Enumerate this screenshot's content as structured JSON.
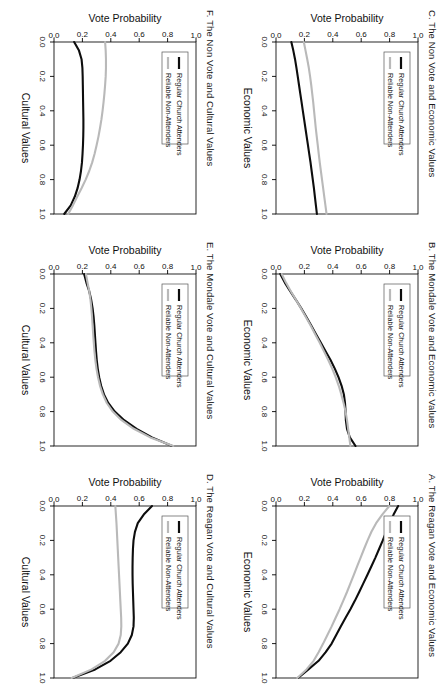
{
  "figure": {
    "orientation": "rotated-90-landscape",
    "series_colors": {
      "black": "#0d0d0d",
      "gray": "#b9b9b9"
    },
    "legend": {
      "series_1_label": "Regular Church Attenders",
      "series_2_label": "Reliable Non-Attenders"
    },
    "axis": {
      "ylabel": "Vote Probability",
      "ticks": [
        "0.0",
        "0.2",
        "0.4",
        "0.6",
        "0.8",
        "1.0"
      ]
    }
  },
  "chart_data": [
    {
      "id": "A",
      "type": "line",
      "title": "A. The Reagan Vote and Economic Values",
      "xlabel": "Economic Values",
      "ylabel": "Vote Probability",
      "xlim": [
        0.0,
        1.0
      ],
      "ylim": [
        0.0,
        1.0
      ],
      "xticks": [
        "0.0",
        "0.2",
        "0.4",
        "0.6",
        "0.8",
        "1.0"
      ],
      "yticks": [
        "0.0",
        "0.2",
        "0.4",
        "0.6",
        "0.8",
        "1.0"
      ],
      "grid": false,
      "legend_position": "top-left",
      "x": [
        0.0,
        0.05,
        0.1,
        0.15,
        0.2,
        0.25,
        0.3,
        0.35,
        0.4,
        0.45,
        0.5,
        0.55,
        0.6,
        0.65,
        0.7,
        0.75,
        0.8,
        0.85,
        0.9,
        0.95,
        1.0
      ],
      "series": [
        {
          "name": "Regular Church Attenders",
          "color": "#0d0d0d",
          "values": [
            0.86,
            0.828,
            0.8,
            0.776,
            0.752,
            0.726,
            0.7,
            0.672,
            0.644,
            0.615,
            0.586,
            0.556,
            0.524,
            0.49,
            0.456,
            0.424,
            0.392,
            0.35,
            0.3,
            0.228,
            0.155
          ]
        },
        {
          "name": "Reliable Non-Attenders",
          "color": "#b9b9b9",
          "values": [
            0.798,
            0.748,
            0.705,
            0.672,
            0.645,
            0.62,
            0.596,
            0.572,
            0.548,
            0.524,
            0.5,
            0.474,
            0.448,
            0.42,
            0.392,
            0.362,
            0.332,
            0.3,
            0.265,
            0.215,
            0.15
          ]
        }
      ]
    },
    {
      "id": "B",
      "type": "line",
      "title": "B. The Mondale Vote and Economic Values",
      "xlabel": "Economic Values",
      "ylabel": "Vote Probability",
      "xlim": [
        0.0,
        1.0
      ],
      "ylim": [
        0.0,
        1.0
      ],
      "xticks": [
        "0.0",
        "0.2",
        "0.4",
        "0.6",
        "0.8",
        "1.0"
      ],
      "yticks": [
        "0.0",
        "0.2",
        "0.4",
        "0.6",
        "0.8",
        "1.0"
      ],
      "grid": false,
      "legend_position": "top-left",
      "x": [
        0.0,
        0.05,
        0.1,
        0.15,
        0.2,
        0.25,
        0.3,
        0.35,
        0.4,
        0.45,
        0.5,
        0.55,
        0.6,
        0.65,
        0.7,
        0.75,
        0.8,
        0.85,
        0.9,
        0.95,
        1.0
      ],
      "series": [
        {
          "name": "Regular Church Attenders",
          "color": "#0d0d0d",
          "values": [
            0.03,
            0.062,
            0.1,
            0.14,
            0.178,
            0.214,
            0.248,
            0.282,
            0.316,
            0.35,
            0.384,
            0.414,
            0.44,
            0.462,
            0.478,
            0.486,
            0.49,
            0.492,
            0.5,
            0.52,
            0.56
          ]
        },
        {
          "name": "Reliable Non-Attenders",
          "color": "#b9b9b9",
          "values": [
            0.04,
            0.07,
            0.104,
            0.14,
            0.176,
            0.21,
            0.244,
            0.276,
            0.308,
            0.338,
            0.368,
            0.396,
            0.42,
            0.442,
            0.46,
            0.476,
            0.49,
            0.5,
            0.508,
            0.516,
            0.524
          ]
        }
      ]
    },
    {
      "id": "C",
      "type": "line",
      "title": "C. The Non Vote and Economic Values",
      "xlabel": "Economic Values",
      "ylabel": "Vote Probability",
      "xlim": [
        0.0,
        1.0
      ],
      "ylim": [
        0.0,
        1.0
      ],
      "xticks": [
        "0.0",
        "0.2",
        "0.4",
        "0.6",
        "0.8",
        "1.0"
      ],
      "yticks": [
        "0.0",
        "0.2",
        "0.4",
        "0.6",
        "0.8",
        "1.0"
      ],
      "grid": false,
      "legend_position": "top-left",
      "x": [
        0.0,
        0.05,
        0.1,
        0.15,
        0.2,
        0.25,
        0.3,
        0.35,
        0.4,
        0.45,
        0.5,
        0.55,
        0.6,
        0.65,
        0.7,
        0.75,
        0.8,
        0.85,
        0.9,
        0.95,
        1.0
      ],
      "series": [
        {
          "name": "Regular Church Attenders",
          "color": "#0d0d0d",
          "values": [
            0.108,
            0.122,
            0.134,
            0.144,
            0.153,
            0.162,
            0.171,
            0.18,
            0.189,
            0.198,
            0.207,
            0.216,
            0.225,
            0.234,
            0.243,
            0.251,
            0.259,
            0.267,
            0.274,
            0.281,
            0.288
          ]
        },
        {
          "name": "Reliable Non-Attenders",
          "color": "#b9b9b9",
          "values": [
            0.196,
            0.208,
            0.22,
            0.231,
            0.24,
            0.248,
            0.255,
            0.262,
            0.268,
            0.274,
            0.28,
            0.287,
            0.294,
            0.301,
            0.308,
            0.316,
            0.324,
            0.332,
            0.34,
            0.348,
            0.356
          ]
        }
      ]
    },
    {
      "id": "D",
      "type": "line",
      "title": "D. The Reagan Vote and Cultural Values",
      "xlabel": "Cultural Values",
      "ylabel": "Vote Probability",
      "xlim": [
        0.0,
        1.0
      ],
      "ylim": [
        0.0,
        1.0
      ],
      "xticks": [
        "0.0",
        "0.2",
        "0.4",
        "0.6",
        "0.8",
        "1.0"
      ],
      "yticks": [
        "0.0",
        "0.2",
        "0.4",
        "0.6",
        "0.8",
        "1.0"
      ],
      "grid": false,
      "legend_position": "top-left",
      "x": [
        0.0,
        0.05,
        0.1,
        0.15,
        0.2,
        0.25,
        0.3,
        0.35,
        0.4,
        0.45,
        0.5,
        0.55,
        0.6,
        0.65,
        0.7,
        0.75,
        0.8,
        0.85,
        0.9,
        0.95,
        1.0
      ],
      "series": [
        {
          "name": "Regular Church Attenders",
          "color": "#0d0d0d",
          "values": [
            0.69,
            0.632,
            0.59,
            0.57,
            0.56,
            0.556,
            0.554,
            0.553,
            0.553,
            0.554,
            0.556,
            0.558,
            0.56,
            0.562,
            0.56,
            0.548,
            0.52,
            0.47,
            0.398,
            0.29,
            0.13
          ]
        },
        {
          "name": "Reliable Non-Attenders",
          "color": "#b9b9b9",
          "values": [
            0.432,
            0.436,
            0.44,
            0.443,
            0.446,
            0.449,
            0.452,
            0.455,
            0.458,
            0.461,
            0.464,
            0.467,
            0.47,
            0.473,
            0.474,
            0.47,
            0.455,
            0.42,
            0.36,
            0.265,
            0.125
          ]
        }
      ]
    },
    {
      "id": "E",
      "type": "line",
      "title": "E. The Mondale Vote and Cultural Values",
      "xlabel": "Cultural Values",
      "ylabel": "Vote Probability",
      "xlim": [
        0.0,
        1.0
      ],
      "ylim": [
        0.0,
        1.0
      ],
      "xticks": [
        "0.0",
        "0.2",
        "0.4",
        "0.6",
        "0.8",
        "1.0"
      ],
      "yticks": [
        "0.0",
        "0.2",
        "0.4",
        "0.6",
        "0.8",
        "1.0"
      ],
      "grid": false,
      "legend_position": "top-left",
      "x": [
        0.0,
        0.05,
        0.1,
        0.15,
        0.2,
        0.25,
        0.3,
        0.35,
        0.4,
        0.45,
        0.5,
        0.55,
        0.6,
        0.65,
        0.7,
        0.75,
        0.8,
        0.85,
        0.9,
        0.95,
        1.0
      ],
      "series": [
        {
          "name": "Regular Church Attenders",
          "color": "#0d0d0d",
          "values": [
            0.212,
            0.228,
            0.248,
            0.262,
            0.272,
            0.279,
            0.284,
            0.288,
            0.292,
            0.296,
            0.301,
            0.308,
            0.318,
            0.332,
            0.352,
            0.382,
            0.428,
            0.494,
            0.582,
            0.69,
            0.832
          ]
        },
        {
          "name": "Reliable Non-Attenders",
          "color": "#b9b9b9",
          "values": [
            0.225,
            0.236,
            0.248,
            0.257,
            0.263,
            0.268,
            0.272,
            0.276,
            0.28,
            0.285,
            0.291,
            0.299,
            0.31,
            0.324,
            0.344,
            0.372,
            0.414,
            0.476,
            0.562,
            0.678,
            0.84
          ]
        }
      ]
    },
    {
      "id": "F",
      "type": "line",
      "title": "F. The Non Vote and Cultural Values",
      "xlabel": "Cultural Values",
      "ylabel": "Vote Probability",
      "xlim": [
        0.0,
        1.0
      ],
      "ylim": [
        0.0,
        1.0
      ],
      "xticks": [
        "0.0",
        "0.2",
        "0.4",
        "0.6",
        "0.8",
        "1.0"
      ],
      "yticks": [
        "0.0",
        "0.2",
        "0.4",
        "0.6",
        "0.8",
        "1.0"
      ],
      "grid": false,
      "legend_position": "top-left",
      "x": [
        0.0,
        0.05,
        0.1,
        0.15,
        0.2,
        0.25,
        0.3,
        0.35,
        0.4,
        0.45,
        0.5,
        0.55,
        0.6,
        0.65,
        0.7,
        0.75,
        0.8,
        0.85,
        0.9,
        0.95,
        1.0
      ],
      "series": [
        {
          "name": "Regular Church Attenders",
          "color": "#0d0d0d",
          "values": [
            0.142,
            0.176,
            0.194,
            0.2,
            0.202,
            0.203,
            0.204,
            0.205,
            0.206,
            0.207,
            0.207,
            0.206,
            0.204,
            0.201,
            0.197,
            0.19,
            0.18,
            0.166,
            0.146,
            0.118,
            0.072
          ]
        },
        {
          "name": "Reliable Non-Attenders",
          "color": "#b9b9b9",
          "values": [
            0.36,
            0.364,
            0.366,
            0.366,
            0.364,
            0.36,
            0.355,
            0.349,
            0.342,
            0.334,
            0.324,
            0.313,
            0.3,
            0.286,
            0.269,
            0.248,
            0.223,
            0.194,
            0.163,
            0.133,
            0.1
          ]
        }
      ]
    }
  ]
}
